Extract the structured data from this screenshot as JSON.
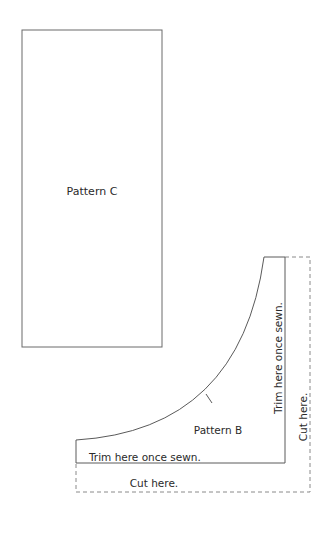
{
  "diagram": {
    "pattern_c": {
      "label": "Pattern C"
    },
    "pattern_b": {
      "label": "Pattern B",
      "trim_bottom": "Trim here once sewn.",
      "trim_right": "Trim here once sewn.",
      "cut_bottom": "Cut here.",
      "cut_right": "Cut here."
    },
    "colors": {
      "line": "#5a5a5a",
      "dash": "#8a8a8a",
      "text": "#2a2a2a"
    }
  }
}
